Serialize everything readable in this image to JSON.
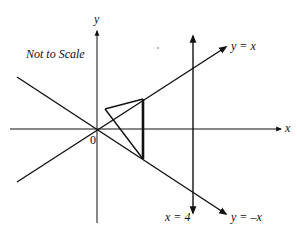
{
  "diagram": {
    "note": "Not to Scale",
    "axes": {
      "x_label": "x",
      "y_label": "y",
      "origin_label": "0"
    },
    "lines": [
      {
        "id": "line-y-eq-x",
        "label": "y = x"
      },
      {
        "id": "line-y-eq-neg-x",
        "label": "y = –x"
      },
      {
        "id": "line-x-eq-4",
        "label": "x = 4"
      }
    ],
    "triangle": {
      "description": "Triangle with one vertex left of the vertical segment between y = x and y = –x",
      "vertices_px": [
        [
          105,
          109
        ],
        [
          143,
          99
        ],
        [
          143,
          159
        ]
      ]
    },
    "colors": {
      "stroke": "#111111",
      "background": "#ffffff"
    }
  }
}
